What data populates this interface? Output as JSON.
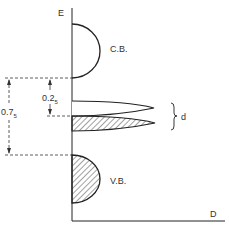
{
  "axes": {
    "y_label": "E",
    "x_label": "D"
  },
  "bands": {
    "conduction": {
      "label": "C.B."
    },
    "valence": {
      "label": "V.B."
    }
  },
  "dimensions": {
    "small_gap": {
      "main": "0.2",
      "sub": "5"
    },
    "large_gap": {
      "main": "0.7",
      "sub": "5"
    }
  },
  "impurity_levels": {
    "brace_label": "d"
  },
  "colors": {
    "line": "#222222",
    "text": "#333333",
    "background": "#ffffff"
  }
}
